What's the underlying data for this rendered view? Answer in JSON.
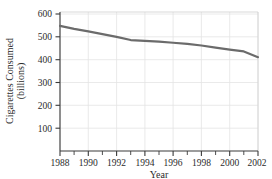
{
  "chart_data": {
    "type": "line",
    "title": "",
    "subtitle": "",
    "xlabel": "Year",
    "ylabel": "Cigarettes Consumed (billions)",
    "ylabel_line1": "Cigarettes Consumed",
    "ylabel_line2": "(billions)",
    "xlim": [
      1988,
      2002
    ],
    "ylim": [
      0,
      600
    ],
    "grid": true,
    "grid_axes": "both",
    "legend": null,
    "legend_position": "none",
    "x_ticks_major": [
      1988,
      1990,
      1992,
      1994,
      1996,
      1998,
      2000,
      2002
    ],
    "x_tick_labels": [
      "1988",
      "1990",
      "1992",
      "1994",
      "1996",
      "1998",
      "2000",
      "2002"
    ],
    "x_ticks_minor": [
      1989,
      1991,
      1993,
      1995,
      1997,
      1999,
      2001
    ],
    "y_ticks": [
      100,
      200,
      300,
      400,
      500,
      600
    ],
    "y_tick_labels": [
      "100",
      "200",
      "300",
      "400",
      "500",
      "600"
    ],
    "series_color": "#6b6b6b",
    "line_width": 2.2,
    "x": [
      1988,
      1989,
      1990,
      1991,
      1992,
      1993,
      1994,
      1995,
      1996,
      1997,
      1998,
      1999,
      2000,
      2001,
      2002
    ],
    "values": [
      548,
      535,
      524,
      512,
      500,
      486,
      482,
      479,
      474,
      469,
      462,
      453,
      444,
      436,
      411
    ],
    "series": [
      {
        "name": "Cigarettes Consumed",
        "values": [
          548,
          535,
          524,
          512,
          500,
          486,
          482,
          479,
          474,
          469,
          462,
          453,
          444,
          436,
          411
        ]
      }
    ]
  },
  "axes": {
    "spine_color": "#3a3a3a",
    "grid_color": "#e2e2e2",
    "tick_color": "#3a3a3a"
  }
}
